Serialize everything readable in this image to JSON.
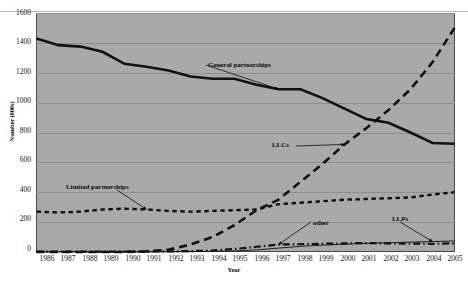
{
  "chart_data": {
    "type": "line",
    "title": "",
    "xlabel": "Year",
    "ylabel": "Number (000s)",
    "xlim": [
      1986,
      2005
    ],
    "ylim": [
      0,
      1600
    ],
    "ytick_step": 200,
    "grid": true,
    "legend_position": "inline-annotations",
    "plot_background": "#a9a9a9",
    "page_background": "#ffffff",
    "series_color": "#111111",
    "categories": [
      "1986",
      "1987",
      "1988",
      "1989",
      "1990",
      "1991",
      "1992",
      "1993",
      "1994",
      "1995",
      "1996",
      "1997",
      "1998",
      "1999",
      "2000",
      "2001",
      "2002",
      "2003",
      "2004",
      "2005"
    ],
    "yticks": [
      "0",
      "200",
      "400",
      "600",
      "800",
      "1000",
      "1200",
      "1400",
      "1600"
    ],
    "series": [
      {
        "name": "General partnerships",
        "style": "thick-solid",
        "values": [
          1430,
          1385,
          1375,
          1340,
          1260,
          1240,
          1215,
          1175,
          1160,
          1160,
          1120,
          1090,
          1090,
          1030,
          960,
          890,
          865,
          800,
          730,
          725
        ]
      },
      {
        "name": "LLCs",
        "style": "long-dash",
        "values": [
          0,
          0,
          0,
          0,
          0,
          5,
          15,
          50,
          100,
          180,
          280,
          350,
          470,
          590,
          720,
          830,
          950,
          1090,
          1270,
          1500
        ]
      },
      {
        "name": "Limited partnerships",
        "style": "short-dash",
        "values": [
          270,
          265,
          270,
          285,
          290,
          285,
          275,
          270,
          275,
          280,
          285,
          320,
          330,
          340,
          350,
          355,
          360,
          365,
          385,
          400
        ]
      },
      {
        "name": "other",
        "style": "dash-dot",
        "values": [
          2,
          2,
          2,
          3,
          3,
          3,
          4,
          6,
          10,
          20,
          35,
          50,
          52,
          55,
          58,
          60,
          58,
          56,
          55,
          58
        ]
      },
      {
        "name": "LLPs",
        "style": "thin-solid",
        "values": [
          0,
          0,
          0,
          0,
          0,
          0,
          1,
          2,
          4,
          7,
          14,
          26,
          38,
          46,
          52,
          58,
          62,
          66,
          70,
          74
        ]
      }
    ],
    "annotations": [
      {
        "label": "General partnerships",
        "target_year": "1997",
        "target_value": 1090
      },
      {
        "label": "LLCs",
        "target_year": "2000",
        "target_value": 720
      },
      {
        "label": "Limited partnerships",
        "target_year": "1991",
        "target_value": 285
      },
      {
        "label": "other",
        "target_year": "1997",
        "target_value": 50
      },
      {
        "label": "LLPs",
        "target_year": "2004",
        "target_value": 70
      }
    ]
  }
}
